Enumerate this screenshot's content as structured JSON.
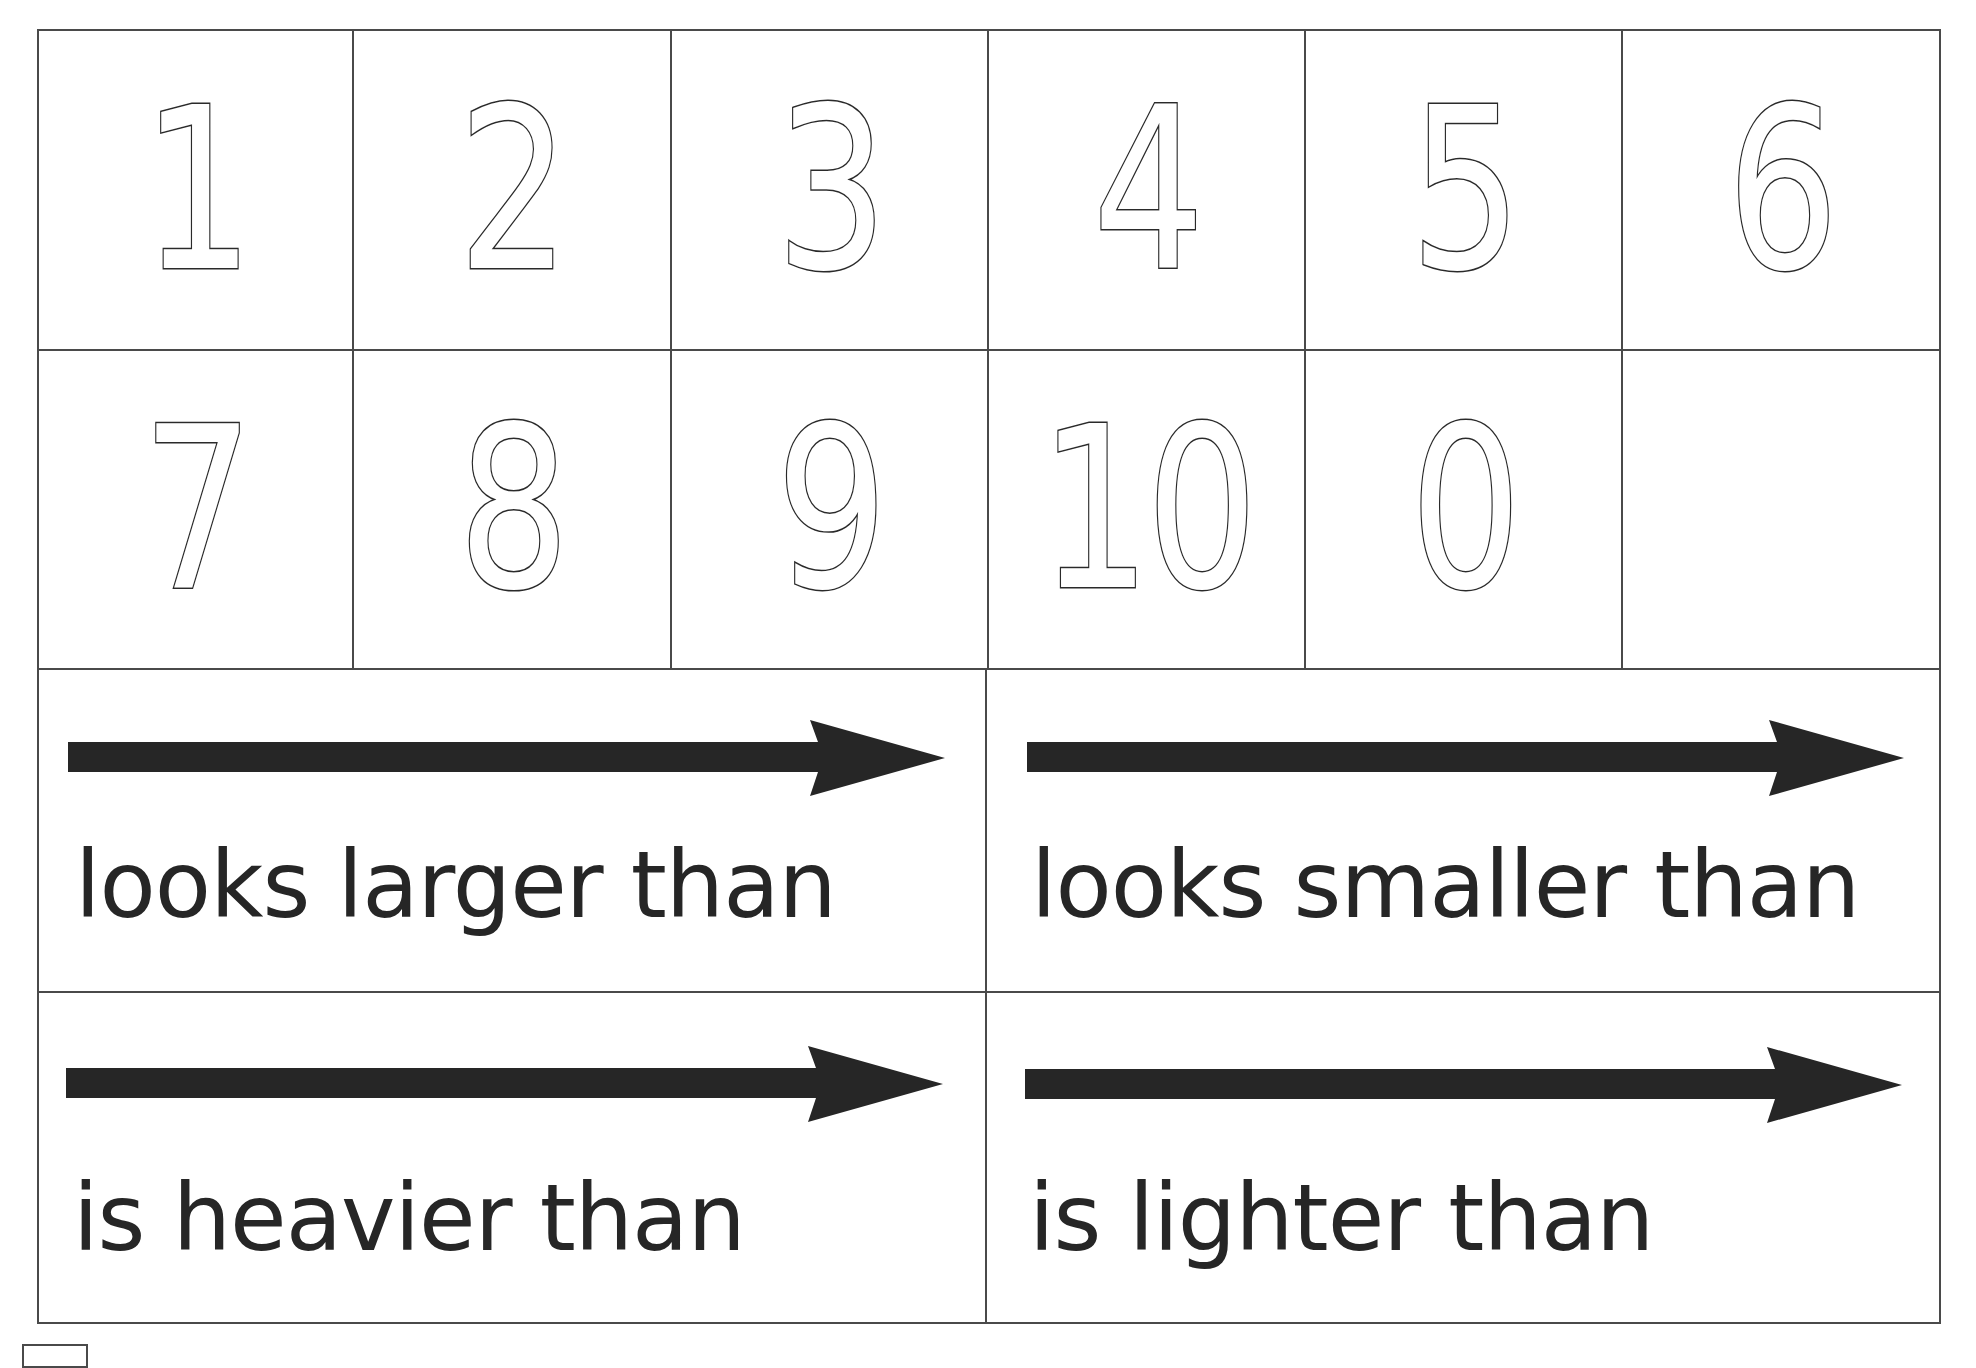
{
  "numeral_cards": [
    {
      "label": "1"
    },
    {
      "label": "2"
    },
    {
      "label": "3"
    },
    {
      "label": "4"
    },
    {
      "label": "5"
    },
    {
      "label": "6"
    },
    {
      "label": "7"
    },
    {
      "label": "8"
    },
    {
      "label": "9"
    },
    {
      "label": "10"
    },
    {
      "label": "0"
    },
    {
      "label": ""
    }
  ],
  "comparison_cards": [
    {
      "label": "looks larger than",
      "icon": "arrow-right-icon"
    },
    {
      "label": "looks smaller than",
      "icon": "arrow-right-icon"
    },
    {
      "label": "is heavier than",
      "icon": "arrow-right-icon"
    },
    {
      "label": "is lighter than",
      "icon": "arrow-right-icon"
    }
  ],
  "colors": {
    "ink": "#262626",
    "grid_line": "#4a4a4a",
    "background": "#ffffff"
  }
}
